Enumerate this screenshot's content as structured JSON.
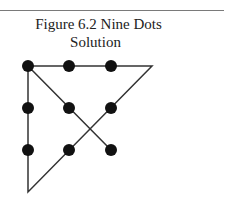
{
  "figure": {
    "title_line1": "Figure 6.2  Nine Dots",
    "title_line2": "Solution"
  },
  "diagram": {
    "dots": [
      {
        "x": 28,
        "y": 66
      },
      {
        "x": 69,
        "y": 66
      },
      {
        "x": 111,
        "y": 66
      },
      {
        "x": 28,
        "y": 108
      },
      {
        "x": 69,
        "y": 108
      },
      {
        "x": 111,
        "y": 108
      },
      {
        "x": 28,
        "y": 150
      },
      {
        "x": 69,
        "y": 150
      },
      {
        "x": 111,
        "y": 150
      }
    ],
    "path": [
      [
        111,
        150
      ],
      [
        28,
        66
      ],
      [
        152,
        66
      ],
      [
        28,
        192
      ],
      [
        28,
        66
      ]
    ],
    "dot_color": "#111111",
    "line_color": "#333333"
  }
}
